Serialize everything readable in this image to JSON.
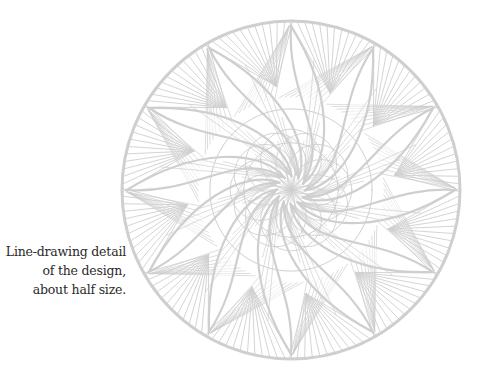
{
  "caption": {
    "lines": [
      "Line-drawing detail",
      "of the design,",
      "about half size."
    ]
  },
  "illustration": {
    "name": "mandala-line-drawing",
    "line_color": "#cfcfcf",
    "center": [
      291,
      190
    ],
    "radius": 169,
    "petals": 12
  }
}
